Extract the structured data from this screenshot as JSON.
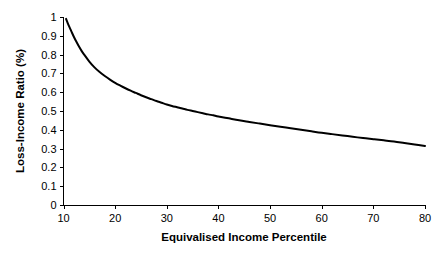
{
  "chart_data": {
    "type": "line",
    "title": "",
    "subtitle": "",
    "xlabel": "Equivalised Income Percentile",
    "ylabel": "Loss-Income Ratio (%)",
    "xlim": [
      10,
      80
    ],
    "ylim": [
      0,
      1
    ],
    "grid": false,
    "legend": false,
    "legend_position": "none",
    "line_color": "#000000",
    "background_color": "#ffffff",
    "xticks": [
      10,
      20,
      30,
      40,
      50,
      60,
      70,
      80
    ],
    "xtick_labels": [
      "10",
      "20",
      "30",
      "40",
      "50",
      "60",
      "70",
      "80"
    ],
    "yticks": [
      0,
      0.1,
      0.2,
      0.3,
      0.4,
      0.5,
      0.6,
      0.7,
      0.8,
      0.9,
      1
    ],
    "ytick_labels": [
      "0",
      "0.1",
      "0.2",
      "0.3",
      "0.4",
      "0.5",
      "0.6",
      "0.7",
      "0.8",
      "0.9",
      "1"
    ],
    "series": [
      {
        "name": "Loss-Income Ratio",
        "x": [
          10.5,
          11,
          11.5,
          12,
          12.5,
          13,
          13.5,
          14,
          15,
          16,
          17,
          18,
          19,
          20,
          21,
          22,
          23,
          24,
          25,
          26,
          27,
          28,
          29,
          30,
          31,
          32,
          33,
          34,
          35,
          36,
          37,
          38,
          39,
          40,
          42,
          44,
          46,
          48,
          50,
          52,
          54,
          56,
          58,
          60,
          62,
          64,
          66,
          68,
          70,
          72,
          74,
          76,
          78,
          80
        ],
        "y": [
          0.99,
          0.955,
          0.925,
          0.895,
          0.868,
          0.843,
          0.82,
          0.8,
          0.763,
          0.732,
          0.707,
          0.686,
          0.667,
          0.65,
          0.635,
          0.621,
          0.608,
          0.596,
          0.584,
          0.573,
          0.563,
          0.553,
          0.544,
          0.535,
          0.527,
          0.52,
          0.513,
          0.506,
          0.5,
          0.494,
          0.488,
          0.482,
          0.477,
          0.471,
          0.461,
          0.451,
          0.442,
          0.433,
          0.424,
          0.416,
          0.408,
          0.4,
          0.392,
          0.384,
          0.377,
          0.37,
          0.363,
          0.356,
          0.35,
          0.344,
          0.338,
          0.33,
          0.322,
          0.314
        ]
      }
    ]
  },
  "axes": {
    "x_title": "Equivalised Income Percentile",
    "y_title": "Loss-Income Ratio (%)"
  }
}
